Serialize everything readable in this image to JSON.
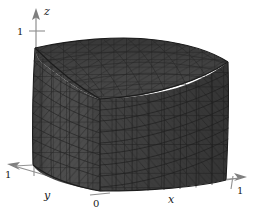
{
  "figure": {
    "kind": "3d-mesh-plot",
    "background_color": "#ffffff",
    "mesh": {
      "object": "unit-cube",
      "surface_color": "#4d4d4d",
      "top_face_color": "#454545",
      "right_face_color": "#3f3f3f",
      "edge_color": "#1f1f1f",
      "shading": "flat-gray",
      "divisions_per_edge": 10,
      "triangulation": "diagonal-split-quads"
    },
    "axes": {
      "x": {
        "label": "x",
        "tick_label": "1",
        "arrow": "right",
        "range": [
          0,
          1
        ]
      },
      "y": {
        "label": "y",
        "tick_label": "1",
        "arrow": "down-left",
        "range": [
          0,
          1
        ]
      },
      "z": {
        "label": "z",
        "tick_label": "1",
        "arrow": "up",
        "range": [
          0,
          1
        ]
      },
      "origin_label": "0",
      "axis_color": "#8a8a8a",
      "label_color": "#1a1a1a"
    }
  }
}
